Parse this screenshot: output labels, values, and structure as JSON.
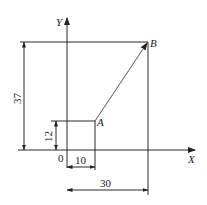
{
  "diagram": {
    "axes": {
      "x_label": "X",
      "y_label": "Y",
      "origin_label": "0"
    },
    "points": [
      {
        "name": "A",
        "x": 10,
        "y": 12
      },
      {
        "name": "B",
        "x": 30,
        "y": 37
      }
    ],
    "vector": {
      "from": "A",
      "to": "B"
    },
    "dimensions": {
      "a_x": "10",
      "a_y": "12",
      "b_x": "30",
      "b_y": "37"
    }
  }
}
